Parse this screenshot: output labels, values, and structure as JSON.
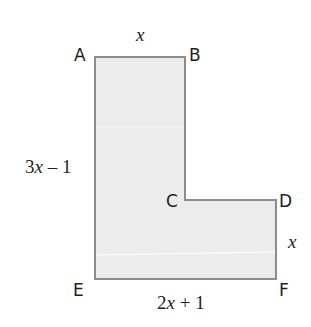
{
  "figure": {
    "shape": "L-shape",
    "fill_color": "#ececec",
    "stroke_color": "#8c8c8c",
    "vertices": [
      {
        "label": "A",
        "x": 95,
        "y": 57
      },
      {
        "label": "B",
        "x": 185,
        "y": 57
      },
      {
        "label": "C",
        "x": 185,
        "y": 200
      },
      {
        "label": "D",
        "x": 276,
        "y": 200
      },
      {
        "label": "F",
        "x": 276,
        "y": 279
      },
      {
        "label": "E",
        "x": 95,
        "y": 279
      }
    ],
    "labels": {
      "A": "A",
      "B": "B",
      "C": "C",
      "D": "D",
      "E": "E",
      "F": "F"
    },
    "dimensions": {
      "top_AB": {
        "var": "x",
        "rest": ""
      },
      "left_AE": {
        "lead": "3",
        "var": "x",
        "rest": " – 1"
      },
      "right_DF": {
        "var": "x",
        "rest": ""
      },
      "bottom_EF": {
        "lead": "2",
        "var": "x",
        "rest": " + 1"
      }
    }
  }
}
